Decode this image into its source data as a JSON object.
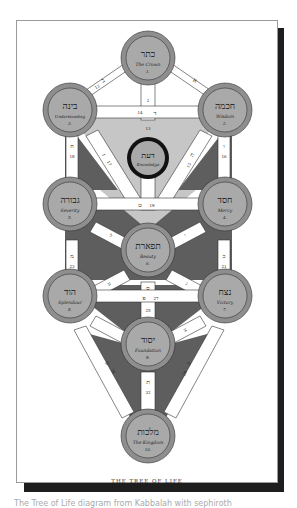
{
  "figure": {
    "caption": "THE TREE OF LIFE",
    "colors": {
      "page_bg": "#ffffff",
      "shadow": "#1e1e1e",
      "sephira_fill": "#a9a9a9",
      "sephira_ring": "#8e8e8e",
      "path_fill": "#ffffff",
      "dark_region": "#5e5e5e",
      "light_region": "#c6c6c6",
      "daath_ring": "#111111"
    }
  },
  "sephiroth": [
    {
      "id": "kether",
      "hebrew": "כתר",
      "english": "The Crown",
      "number": "1."
    },
    {
      "id": "chokmah",
      "hebrew": "חכמה",
      "english": "Wisdom",
      "number": "2."
    },
    {
      "id": "binah",
      "hebrew": "בינה",
      "english": "Understanding",
      "number": "3."
    },
    {
      "id": "chesed",
      "hebrew": "חסד",
      "english": "Mercy",
      "number": "4."
    },
    {
      "id": "geburah",
      "hebrew": "גבורה",
      "english": "Severity",
      "number": "5."
    },
    {
      "id": "tiphareth",
      "hebrew": "תפארת",
      "english": "Beauty",
      "number": "6."
    },
    {
      "id": "netzach",
      "hebrew": "נצח",
      "english": "Victory",
      "number": "7."
    },
    {
      "id": "hod",
      "hebrew": "הוד",
      "english": "Splendour",
      "number": "8."
    },
    {
      "id": "yesod",
      "hebrew": "יסוד",
      "english": "Foundation",
      "number": "9."
    },
    {
      "id": "malkuth",
      "hebrew": "מלכות",
      "english": "The Kingdom",
      "number": "10."
    },
    {
      "id": "daath",
      "hebrew": "דעת",
      "english": "Knowledge",
      "number": ""
    }
  ],
  "paths": [
    {
      "number": "11",
      "letter": "א"
    },
    {
      "number": "12",
      "letter": "ב"
    },
    {
      "number": "13",
      "letter": "ג"
    },
    {
      "number": "14",
      "letter": "ד"
    },
    {
      "number": "15",
      "letter": "ה"
    },
    {
      "number": "16",
      "letter": "ו"
    },
    {
      "number": "17",
      "letter": "ז"
    },
    {
      "number": "18",
      "letter": "ח"
    },
    {
      "number": "19",
      "letter": "ט"
    },
    {
      "number": "20",
      "letter": "י"
    },
    {
      "number": "21",
      "letter": "כ"
    },
    {
      "number": "22",
      "letter": "ל"
    },
    {
      "number": "23",
      "letter": "מ"
    },
    {
      "number": "24",
      "letter": "נ"
    },
    {
      "number": "25",
      "letter": "ס"
    },
    {
      "number": "26",
      "letter": "ע"
    },
    {
      "number": "27",
      "letter": "פ"
    },
    {
      "number": "28",
      "letter": "צ"
    },
    {
      "number": "29",
      "letter": "ק"
    },
    {
      "number": "31",
      "letter": "ש"
    },
    {
      "number": "32",
      "letter": "ת"
    }
  ],
  "footer_text": "The Tree of Life diagram from Kabbalah with sephiroth"
}
